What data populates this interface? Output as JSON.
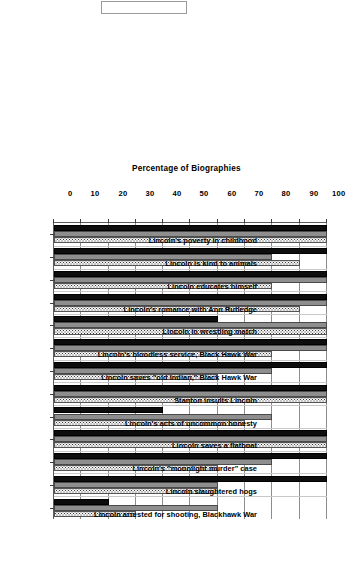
{
  "title_box": {
    "label": "",
    "present": true
  },
  "chart_data": {
    "type": "bar",
    "orientation": "vertical-rotated",
    "title": "",
    "xlabel": "",
    "ylabel": "Percentage of Biographies",
    "ylim": [
      0,
      100
    ],
    "yticks": [
      0,
      10,
      20,
      30,
      40,
      50,
      60,
      70,
      80,
      90,
      100
    ],
    "grid": true,
    "legend": false,
    "legend_position": "none",
    "categories": [
      "Lincoln's poverty in childhood",
      "Lincoln is kind to animals",
      "Lincoln educates himself",
      "Lincoln's romance with Ann Rutledge",
      "Lincoln in wrestling match",
      "Lincoln's bloodless service, Black Hawk War",
      "Lincoln saves \"old Indian,\" Black Hawk War",
      "Stanton insults Lincoln",
      "Lincoln's acts of uncommon honesty",
      "Lincoln saves a flatboat",
      "Lincoln's \"moonlight murder\" case",
      "Lincoln slaughtered hogs",
      "Lincoln arrested for shooting, Blackhawk War"
    ],
    "series": [
      {
        "name": "Series 1",
        "pattern": "solid-black",
        "color": "#0d0d0d",
        "values": [
          100,
          100,
          100,
          100,
          60,
          100,
          100,
          100,
          40,
          100,
          100,
          100,
          20
        ]
      },
      {
        "name": "Series 2",
        "pattern": "solid-gray",
        "color": "#8e8e8e",
        "values": [
          100,
          80,
          100,
          100,
          100,
          100,
          80,
          100,
          80,
          100,
          80,
          60,
          60
        ]
      },
      {
        "name": "Series 3",
        "pattern": "stippled-light",
        "color": "#f4f4f4",
        "values": [
          100,
          90,
          80,
          90,
          100,
          80,
          60,
          100,
          70,
          100,
          60,
          60,
          30
        ]
      }
    ]
  },
  "colors": {
    "series_black": "#0d0d0d",
    "series_gray": "#8e8e8e",
    "series_stipple": "#f4f4f4",
    "grid": "#8d8d8d",
    "axis": "#5d5d5d"
  }
}
